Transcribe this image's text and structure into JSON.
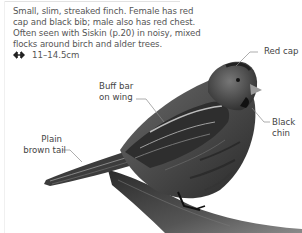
{
  "description": {
    "text": "Small, slim, streaked finch. Female has red cap and black bib; male also has red chest. Often seen with Siskin (p.20) in noisy, mixed flocks around birch and alder trees.",
    "lines": [
      "Small, slim, streaked finch. Female has red",
      "cap and black bib; male also has red chest.",
      "Often seen with Siskin (p.20) in noisy, mixed",
      "flocks around birch and alder trees."
    ]
  },
  "size": {
    "icon": "size-arrows-icon",
    "value": "11–14.5cm"
  },
  "labels": {
    "red_cap": "Red cap",
    "buff_bar": [
      "Buff bar",
      "on wing"
    ],
    "black_chin": [
      "Black",
      "chin"
    ],
    "plain_tail": [
      "Plain",
      "brown tail"
    ]
  },
  "colors": {
    "text": "#555555",
    "label_text": "#444444",
    "leader_line": "#8a8a8a",
    "background": "#ffffff"
  }
}
